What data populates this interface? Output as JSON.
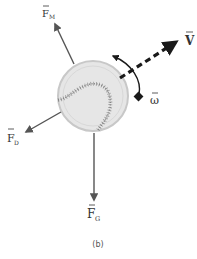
{
  "diagram": {
    "type": "free-body diagram",
    "caption": "(b)",
    "labels": {
      "magnus": {
        "main": "F",
        "sub": "M"
      },
      "drag": {
        "main": "F",
        "sub": "D"
      },
      "gravity": {
        "main": "F",
        "sub": "G"
      },
      "velocity": {
        "main": "V"
      },
      "angular_velocity": {
        "main": "ω"
      }
    },
    "colors": {
      "arrow": "#555555",
      "dark_arrow": "#1a1a1a",
      "ball_fill": "#e6e6e6",
      "ball_edge": "#c8c8c8",
      "stitches": "#7a7a7a"
    }
  }
}
